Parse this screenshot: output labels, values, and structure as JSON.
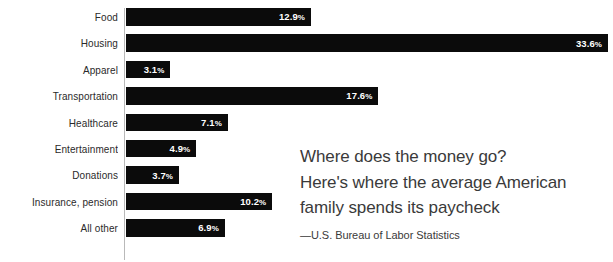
{
  "chart_data": {
    "type": "bar",
    "orientation": "horizontal",
    "title": "",
    "xlabel": "",
    "ylabel": "",
    "xlim": [
      0,
      33.6
    ],
    "grid": false,
    "legend": false,
    "value_suffix": "%",
    "categories": [
      "Food",
      "Housing",
      "Apparel",
      "Transportation",
      "Healthcare",
      "Entertainment",
      "Donations",
      "Insurance, pension",
      "All other"
    ],
    "values": [
      12.9,
      33.6,
      3.1,
      17.6,
      7.1,
      4.9,
      3.7,
      10.2,
      6.9
    ],
    "value_labels": [
      "12.9%",
      "33.6%",
      "3.1%",
      "17.6%",
      "7.1%",
      "4.9%",
      "3.7%",
      "10.2%",
      "6.9%"
    ],
    "bar_color": "#0b0b0b",
    "value_label_color": "#ffffff",
    "category_label_color": "#2a2a2a",
    "axis_color": "#b9b9b9"
  },
  "rows": [
    {
      "label": "Food",
      "value": 12.9,
      "value_label": "12.9",
      "pct": "%"
    },
    {
      "label": "Housing",
      "value": 33.6,
      "value_label": "33.6",
      "pct": "%"
    },
    {
      "label": "Apparel",
      "value": 3.1,
      "value_label": "3.1",
      "pct": "%"
    },
    {
      "label": "Transportation",
      "value": 17.6,
      "value_label": "17.6",
      "pct": "%"
    },
    {
      "label": "Healthcare",
      "value": 7.1,
      "value_label": "7.1",
      "pct": "%"
    },
    {
      "label": "Entertainment",
      "value": 4.9,
      "value_label": "4.9",
      "pct": "%"
    },
    {
      "label": "Donations",
      "value": 3.7,
      "value_label": "3.7",
      "pct": "%"
    },
    {
      "label": "Insurance, pension",
      "value": 10.2,
      "value_label": "10.2",
      "pct": "%"
    },
    {
      "label": "All other",
      "value": 6.9,
      "value_label": "6.9",
      "pct": "%"
    }
  ],
  "caption": {
    "headline_lines": [
      "Where does the money go?",
      "Here's where the average American",
      "family spends its paycheck"
    ],
    "source": "—U.S. Bureau of Labor Statistics"
  }
}
